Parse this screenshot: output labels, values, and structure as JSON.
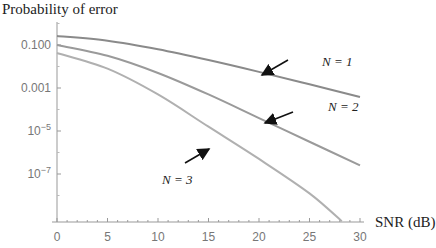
{
  "chart_data": {
    "type": "line",
    "title": "",
    "ylabel": "Probability of error",
    "xlabel": "SNR (dB)",
    "yscale": "log",
    "xlim": [
      0,
      30
    ],
    "ylim_log10": [
      -9.2,
      0.1
    ],
    "x_ticks": [
      "0",
      "5",
      "10",
      "15",
      "20",
      "25",
      "30"
    ],
    "x_tick_values": [
      0,
      5,
      10,
      15,
      20,
      25,
      30
    ],
    "y_ticks": [
      {
        "label": "0.100",
        "base": "",
        "exp": "",
        "log10": -1
      },
      {
        "label": "0.001",
        "base": "",
        "exp": "",
        "log10": -3
      },
      {
        "label": "",
        "base": "10",
        "exp": "−5",
        "log10": -5
      },
      {
        "label": "",
        "base": "10",
        "exp": "−7",
        "log10": -7
      }
    ],
    "grid": false,
    "series": [
      {
        "name": "N = 1",
        "x": [
          0,
          5,
          10,
          15,
          20,
          25,
          30
        ],
        "log10_y": [
          -0.58,
          -0.8,
          -1.2,
          -1.7,
          -2.25,
          -2.83,
          -3.42
        ],
        "color": "#8a8a8a"
      },
      {
        "name": "N = 2",
        "x": [
          0,
          5,
          10,
          15,
          20,
          25,
          30
        ],
        "log10_y": [
          -1.0,
          -1.5,
          -2.3,
          -3.3,
          -4.4,
          -5.5,
          -6.6
        ],
        "color": "#9a9a9a"
      },
      {
        "name": "N = 3",
        "x": [
          0,
          5,
          10,
          15,
          20,
          25,
          28.2
        ],
        "log10_y": [
          -1.37,
          -2.1,
          -3.3,
          -4.8,
          -6.3,
          -7.9,
          -9.2
        ],
        "color": "#b0b0b0"
      }
    ],
    "annotations": [
      {
        "text": "N = 1",
        "arrow_to_x": 20,
        "series": "N = 1"
      },
      {
        "text": "N = 2",
        "arrow_to_x": 20,
        "series": "N = 2"
      },
      {
        "text": "N = 3",
        "arrow_to_x": 15.5,
        "series": "N = 3"
      }
    ]
  }
}
